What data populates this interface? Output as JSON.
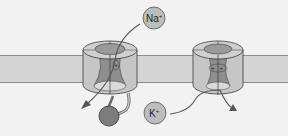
{
  "diagram": {
    "type": "membrane-channel-illustration",
    "membrane": {
      "color": "#d4d4d4",
      "edge_color": "#8a8a8a"
    },
    "channels": [
      {
        "name": "sodium-channel",
        "ion_label": "Na",
        "ion_charge": "+",
        "inner_charges": [
          "+"
        ],
        "flow": "inward",
        "has_inactivation_ball": true
      },
      {
        "name": "potassium-channel",
        "ion_label": "K",
        "ion_charge": "+",
        "inner_charges": [
          "+",
          "+"
        ],
        "flow": "outward"
      }
    ],
    "colors": {
      "background": "#f2f2f2",
      "channel_body": "#c9c9c9",
      "pore": "#8e8e8e",
      "ion_fill": "#bdbdbd",
      "ball_fill": "#7d7d7d",
      "outline": "#3a3a3a"
    }
  }
}
